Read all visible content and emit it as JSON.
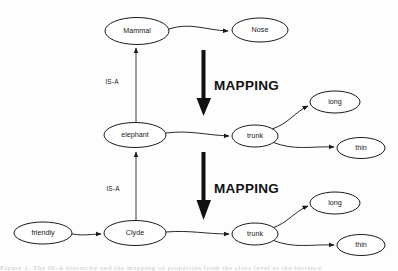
{
  "figure": {
    "kind": "semantic-network-diagram",
    "background_color": "#fdfdfd",
    "line_color": "#1a1a1a",
    "caption_partial": "Figure 1. The IS-A hierarchy and the mapping of properties from the class level to the instance"
  },
  "nodes": {
    "mammal": {
      "label": "Mammal",
      "cx": 137,
      "cy": 31,
      "rx": 32,
      "ry": 13.5
    },
    "nose": {
      "label": "Nose",
      "cx": 260,
      "cy": 30,
      "rx": 28,
      "ry": 12
    },
    "elephant": {
      "label": "elephant",
      "cx": 135,
      "cy": 135,
      "rx": 31,
      "ry": 12.5
    },
    "trunk_top": {
      "label": "trunk",
      "cx": 255,
      "cy": 136,
      "rx": 23,
      "ry": 11
    },
    "long_top": {
      "label": "long",
      "cx": 335,
      "cy": 102,
      "rx": 25,
      "ry": 11
    },
    "thin_top": {
      "label": "thin",
      "cx": 361,
      "cy": 148,
      "rx": 24,
      "ry": 10.5
    },
    "friendly": {
      "label": "friendly",
      "cx": 43,
      "cy": 233,
      "rx": 29,
      "ry": 11
    },
    "clyde": {
      "label": "Clyde",
      "cx": 135,
      "cy": 233,
      "rx": 31,
      "ry": 12.5
    },
    "trunk_bottom": {
      "label": "trunk",
      "cx": 255,
      "cy": 234,
      "rx": 23,
      "ry": 11
    },
    "long_bottom": {
      "label": "long",
      "cx": 335,
      "cy": 203,
      "rx": 25,
      "ry": 11
    },
    "thin_bottom": {
      "label": "thin",
      "cx": 361,
      "cy": 245,
      "rx": 24,
      "ry": 10.5
    }
  },
  "edges": {
    "isa_upper_label": "IS-A",
    "isa_lower_label": "IS-A"
  },
  "mapping": {
    "upper_label": "MAPPING",
    "lower_label": "MAPPING"
  }
}
